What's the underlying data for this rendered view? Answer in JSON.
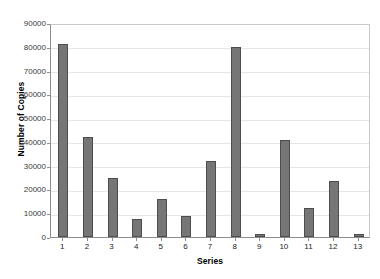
{
  "chart_data": {
    "type": "bar",
    "title": "",
    "xlabel": "Series",
    "ylabel": "Number of Copies",
    "categories": [
      "1",
      "2",
      "3",
      "4",
      "5",
      "6",
      "7",
      "8",
      "9",
      "10",
      "11",
      "12",
      "13"
    ],
    "values": [
      81000,
      42000,
      25000,
      7500,
      16000,
      9000,
      32000,
      80000,
      1200,
      41000,
      12000,
      23500,
      1200
    ],
    "ylim": [
      0,
      90000
    ],
    "yticks": [
      0,
      10000,
      20000,
      30000,
      40000,
      50000,
      60000,
      70000,
      80000,
      90000
    ],
    "ytick_labels": [
      "0",
      "10000",
      "20000",
      "30000",
      "40000",
      "50000",
      "60000",
      "70000",
      "80000",
      "90000"
    ],
    "grid": true,
    "legend": false,
    "series": [
      {
        "name": "Number of Copies",
        "values": [
          81000,
          42000,
          25000,
          7500,
          16000,
          9000,
          32000,
          80000,
          1200,
          41000,
          12000,
          23500,
          1200
        ]
      }
    ],
    "colors": {
      "bar_fill": "#767676",
      "bar_stroke": "#4d4d4d",
      "gridline": "#e6e6e6",
      "axis": "#8d8d8d",
      "background": "#ffffff",
      "text": "#000000"
    }
  }
}
